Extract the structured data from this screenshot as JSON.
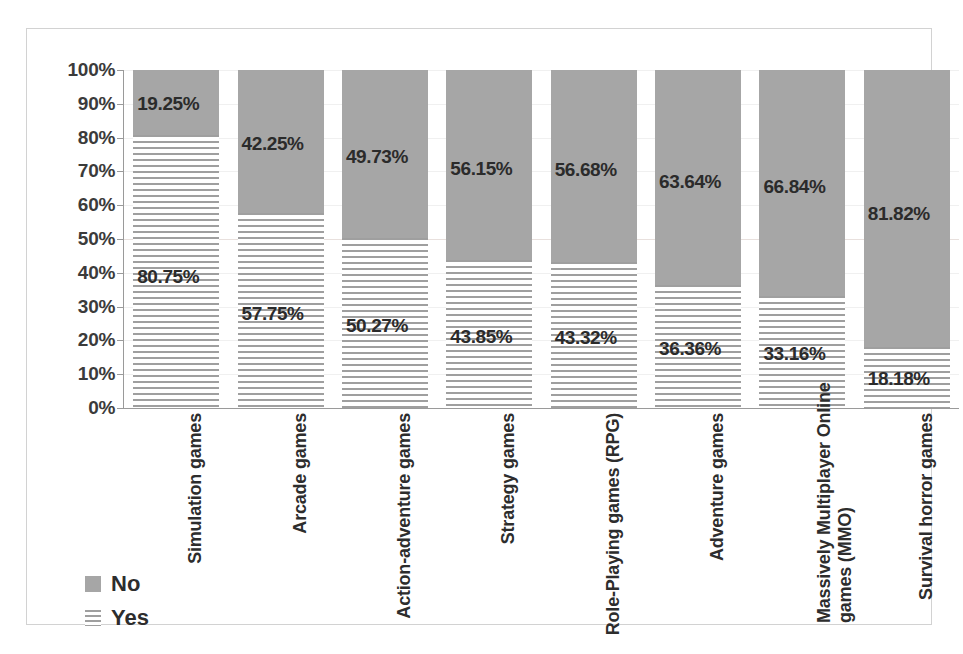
{
  "chart_data": {
    "type": "bar",
    "subtype": "stacked-100-percent",
    "title": "",
    "subtitle": "",
    "xlabel": "",
    "ylabel": "",
    "ylim": [
      0,
      100
    ],
    "grid": true,
    "legend_position": "bottom-left",
    "categories": [
      "Simulation games",
      "Arcade games",
      "Action-adventure games",
      "Strategy games",
      "Role-Playing games (RPG)",
      "Adventure games",
      "Massively Multiplayer Online games (MMO)",
      "Survival horror games"
    ],
    "category_lines": [
      [
        "Simulation games"
      ],
      [
        "Arcade games"
      ],
      [
        "Action-adventure games"
      ],
      [
        "Strategy games"
      ],
      [
        "Role-Playing games (RPG)"
      ],
      [
        "Adventure games"
      ],
      [
        "Massively Multiplayer Online",
        "games (MMO)"
      ],
      [
        "Survival horror games"
      ]
    ],
    "series": [
      {
        "name": "No",
        "color": "#a6a6a6",
        "pattern": "solid",
        "values": [
          19.25,
          42.25,
          49.73,
          56.15,
          56.68,
          63.64,
          66.84,
          81.82
        ],
        "labels": [
          "19.25%",
          "42.25%",
          "49.73%",
          "56.15%",
          "56.68%",
          "63.64%",
          "66.84%",
          "81.82%"
        ]
      },
      {
        "name": "Yes",
        "color": "#9f9f9f",
        "pattern": "wavy-horizontal-hatch",
        "values": [
          80.75,
          57.75,
          50.27,
          43.85,
          43.32,
          36.36,
          33.16,
          18.18
        ],
        "labels": [
          "80.75%",
          "57.75%",
          "50.27%",
          "43.85%",
          "43.32%",
          "36.36%",
          "33.16%",
          "18.18%"
        ]
      }
    ],
    "ytick_values": [
      0,
      10,
      20,
      30,
      40,
      50,
      60,
      70,
      80,
      90,
      100
    ],
    "ytick_labels": [
      "0%",
      "10%",
      "20%",
      "30%",
      "40%",
      "50%",
      "60%",
      "70%",
      "80%",
      "90%",
      "100%"
    ]
  },
  "legend": {
    "items": [
      {
        "label": "No",
        "swatch": "solid-gray-swatch"
      },
      {
        "label": "Yes",
        "swatch": "hatched-gray-swatch"
      }
    ]
  }
}
